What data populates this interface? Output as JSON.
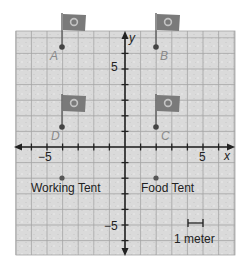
{
  "figure": {
    "type": "coordinate-plane-map",
    "axes": {
      "x_label": "x",
      "y_label": "y",
      "tick_labels": {
        "x_neg": "−5",
        "x_pos": "5",
        "y_pos": "5",
        "y_neg": "−5"
      },
      "x_range": [
        -7,
        7
      ],
      "y_range": [
        -7,
        7.5
      ]
    },
    "flags": [
      {
        "label": "A",
        "x": -4,
        "y": 6
      },
      {
        "label": "B",
        "x": 2,
        "y": 6
      },
      {
        "label": "C",
        "x": 2,
        "y": 1
      },
      {
        "label": "D",
        "x": -4,
        "y": 1
      }
    ],
    "points": [
      {
        "label": "Working Tent",
        "x": -4,
        "y": -2
      },
      {
        "label": "Food Tent",
        "x": 2,
        "y": -2
      }
    ],
    "scale": {
      "label": "1 meter",
      "length_units": 1
    },
    "colors": {
      "grid_bg": "#dcdcdc",
      "grid_line": "#9a9a9a",
      "axis": "#222222",
      "flag": "#7a7a7a",
      "flag_emblem": "#b8b8b8",
      "point": "#555555",
      "label_faded": "#8a8a8a",
      "text": "#222222"
    }
  }
}
